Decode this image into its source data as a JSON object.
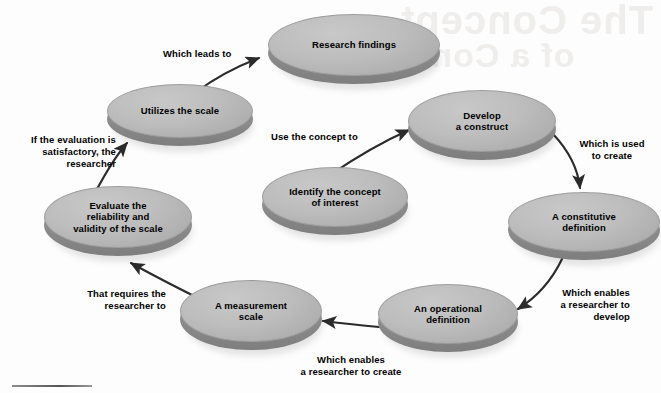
{
  "diagram": {
    "type": "cycle-flow-diagram",
    "node_fill_color": "#bdbdbd",
    "node_rim_color": "#8f8f8f",
    "text_color": "#000000",
    "background_color": "#fdfdfd",
    "nodes": [
      {
        "id": "research-findings",
        "label": "Research findings"
      },
      {
        "id": "utilizes-the-scale",
        "label": "Utilizes the scale"
      },
      {
        "id": "develop-a-construct",
        "label": "Develop\na construct"
      },
      {
        "id": "a-constitutive-definition",
        "label": "A constitutive\ndefinition"
      },
      {
        "id": "identify-the-concept",
        "label": "Identify the concept\nof interest"
      },
      {
        "id": "evaluate-the-scale",
        "label": "Evaluate the\nreliability and\nvalidity of the scale"
      },
      {
        "id": "a-measurement-scale",
        "label": "A measurement\nscale"
      },
      {
        "id": "an-operational-definition",
        "label": "An operational\ndefinition"
      }
    ],
    "connectors": [
      {
        "id": "use-the-concept-to",
        "label": "Use the concept to",
        "from": "identify-the-concept",
        "to": "develop-a-construct"
      },
      {
        "id": "which-is-used-to-create",
        "label": "Which is used\nto create",
        "from": "develop-a-construct",
        "to": "a-constitutive-definition"
      },
      {
        "id": "which-enables-develop",
        "label": "Which enables\na researcher to\ndevelop",
        "from": "a-constitutive-definition",
        "to": "an-operational-definition"
      },
      {
        "id": "which-enables-create",
        "label": "Which enables\na researcher to create",
        "from": "an-operational-definition",
        "to": "a-measurement-scale"
      },
      {
        "id": "that-requires-researcher",
        "label": "That requires the\nresearcher to",
        "from": "a-measurement-scale",
        "to": "evaluate-the-scale"
      },
      {
        "id": "if-evaluation-satisfactory",
        "label": "If the evaluation is\nsatisfactory, the\nresearcher",
        "from": "evaluate-the-scale",
        "to": "utilizes-the-scale"
      },
      {
        "id": "which-leads-to",
        "label": "Which leads to",
        "from": "utilizes-the-scale",
        "to": "research-findings"
      }
    ]
  }
}
